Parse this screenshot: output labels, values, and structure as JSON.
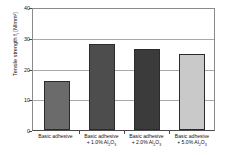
{
  "chart_data": {
    "type": "bar",
    "title": "",
    "xlabel": "",
    "ylabel": "Tensile strength f_t [N/mm²]",
    "ylabel_main": "Tensile strength f",
    "ylabel_sub": "t",
    "ylabel_unit": " [N/mm²]",
    "ylim": [
      0,
      40
    ],
    "ytick_labels": [
      "0",
      "10",
      "20",
      "30",
      "40"
    ],
    "ytick_values": [
      0,
      10,
      20,
      30,
      40
    ],
    "grid": true,
    "legend": "none",
    "categories": [
      "Basic adhesive",
      "Basic adhesive + 1.0% Al2O3",
      "Basic adhesive + 2.0% Al2O3",
      "Basic adhesive + 5.0% Al2O3"
    ],
    "category_lines": [
      {
        "line1": "Basic adhesive",
        "line2": "",
        "line2_pre": "",
        "line2_sub1": "",
        "line2_mid": "",
        "line2_sub2": ""
      },
      {
        "line1": "Basic adhesive",
        "line2": "+ 1.0% Al2O3",
        "line2_pre": "+ 1.0% Al",
        "line2_sub1": "2",
        "line2_mid": "O",
        "line2_sub2": "3"
      },
      {
        "line1": "Basic adhesive",
        "line2": "+ 2.0% Al2O3",
        "line2_pre": "+ 2.0% Al",
        "line2_sub1": "2",
        "line2_mid": "O",
        "line2_sub2": "3"
      },
      {
        "line1": "Basic adhesive",
        "line2": "+ 5.0% Al2O3",
        "line2_pre": "+ 5.0% Al",
        "line2_sub1": "2",
        "line2_mid": "O",
        "line2_sub2": "3"
      }
    ],
    "values": [
      16.2,
      28.4,
      26.9,
      25.2
    ],
    "bar_colors": [
      "#6b6b6b",
      "#4d4d4d",
      "#3b3b3b",
      "#c9c9c9"
    ],
    "bar_border_color": "#2b2b2b",
    "axis_color": "#4a4a4a",
    "grid_color": "#a9a9a9",
    "background": "#ffffff"
  }
}
